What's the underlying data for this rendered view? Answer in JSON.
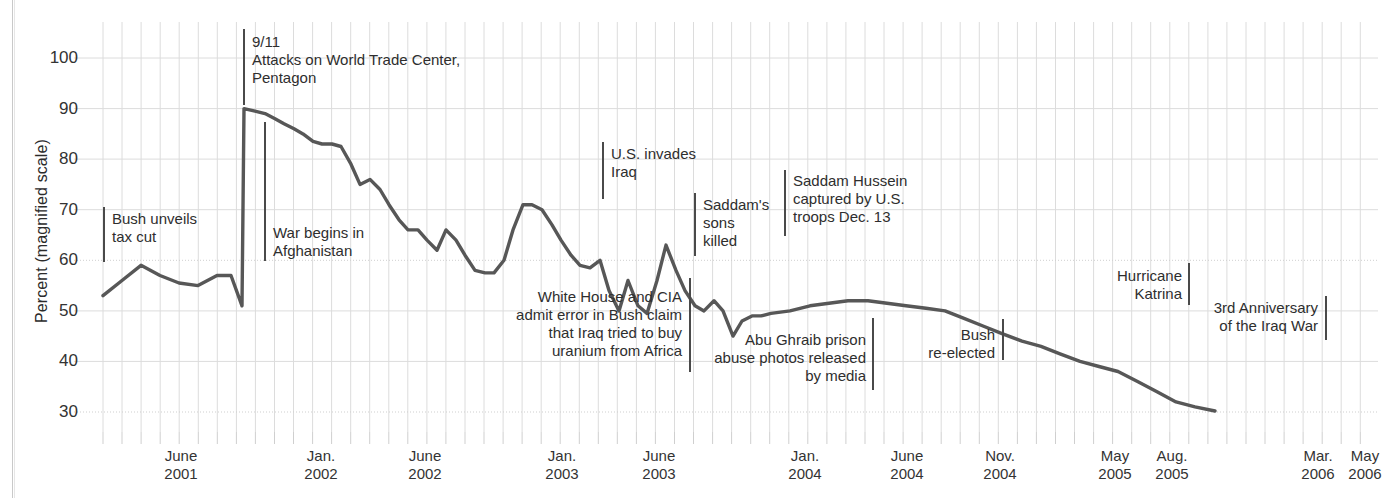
{
  "figure": {
    "width": 1385,
    "height": 498,
    "background": "#ffffff",
    "line_color": "#575757",
    "grid_color": "#dcdcdc",
    "text_color": "#2e2e2e"
  },
  "chart_data": {
    "type": "line",
    "title": "",
    "subtitle": "",
    "xlabel": "",
    "ylabel": "Percent (magnified scale)",
    "ylim": [
      28,
      104
    ],
    "yticks": [
      30,
      40,
      50,
      60,
      70,
      80,
      90,
      100
    ],
    "grid": true,
    "legend": "none",
    "xtick_labels": [
      {
        "line1": "June",
        "line2": "2001",
        "x_px": 181
      },
      {
        "line1": "Jan.",
        "line2": "2002",
        "x_px": 321
      },
      {
        "line1": "June",
        "line2": "2002",
        "x_px": 425
      },
      {
        "line1": "Jan.",
        "line2": "2003",
        "x_px": 562
      },
      {
        "line1": "June",
        "line2": "2003",
        "x_px": 659
      },
      {
        "line1": "Jan.",
        "line2": "2004",
        "x_px": 805
      },
      {
        "line1": "June",
        "line2": "2004",
        "x_px": 907
      },
      {
        "line1": "Nov.",
        "line2": "2004",
        "x_px": 1000
      },
      {
        "line1": "May",
        "line2": "2005",
        "x_px": 1115
      },
      {
        "line1": "Aug.",
        "line2": "2005",
        "x_px": 1172
      },
      {
        "line1": "Mar.",
        "line2": "2006",
        "x_px": 1318
      },
      {
        "line1": "May",
        "line2": "2006",
        "x_px": 1365
      }
    ],
    "series": [
      {
        "name": "Presidential approval",
        "points": [
          [
            103,
            53
          ],
          [
            122,
            56
          ],
          [
            141,
            59
          ],
          [
            160,
            57
          ],
          [
            179,
            55.5
          ],
          [
            198,
            55
          ],
          [
            217,
            57
          ],
          [
            231,
            57
          ],
          [
            242,
            51
          ],
          [
            244,
            90
          ],
          [
            255,
            89.5
          ],
          [
            265,
            89
          ],
          [
            275,
            88
          ],
          [
            284,
            87
          ],
          [
            294,
            86
          ],
          [
            303,
            85
          ],
          [
            313,
            83.5
          ],
          [
            322,
            83
          ],
          [
            332,
            83
          ],
          [
            341,
            82.5
          ],
          [
            351,
            79
          ],
          [
            360,
            75
          ],
          [
            370,
            76
          ],
          [
            380,
            74
          ],
          [
            389,
            71
          ],
          [
            399,
            68
          ],
          [
            408,
            66
          ],
          [
            418,
            66
          ],
          [
            427,
            64
          ],
          [
            437,
            62
          ],
          [
            446,
            66
          ],
          [
            456,
            64
          ],
          [
            465,
            61
          ],
          [
            475,
            58
          ],
          [
            485,
            57.5
          ],
          [
            494,
            57.5
          ],
          [
            504,
            60
          ],
          [
            513,
            66
          ],
          [
            523,
            71
          ],
          [
            532,
            71
          ],
          [
            542,
            70
          ],
          [
            552,
            67
          ],
          [
            561,
            64
          ],
          [
            571,
            61
          ],
          [
            580,
            59
          ],
          [
            590,
            58.5
          ],
          [
            600,
            60
          ],
          [
            609,
            54
          ],
          [
            619,
            50
          ],
          [
            628,
            56
          ],
          [
            638,
            51
          ],
          [
            647,
            49.5
          ],
          [
            657,
            56
          ],
          [
            666,
            63
          ],
          [
            676,
            58
          ],
          [
            685,
            54
          ],
          [
            695,
            51
          ],
          [
            704,
            50
          ],
          [
            714,
            52
          ],
          [
            723,
            50
          ],
          [
            733,
            45
          ],
          [
            742,
            48
          ],
          [
            752,
            49
          ],
          [
            761,
            49
          ],
          [
            771,
            49.5
          ],
          [
            790,
            50
          ],
          [
            810,
            51
          ],
          [
            829,
            51.5
          ],
          [
            848,
            52
          ],
          [
            868,
            52
          ],
          [
            887,
            51.5
          ],
          [
            906,
            51
          ],
          [
            926,
            50.5
          ],
          [
            945,
            50
          ],
          [
            964,
            48.5
          ],
          [
            983,
            47
          ],
          [
            1002,
            45.5
          ],
          [
            1022,
            44
          ],
          [
            1041,
            43
          ],
          [
            1060,
            41.5
          ],
          [
            1080,
            40
          ],
          [
            1099,
            39
          ],
          [
            1118,
            38
          ],
          [
            1138,
            36
          ],
          [
            1157,
            34
          ],
          [
            1176,
            32
          ],
          [
            1195,
            31
          ],
          [
            1215,
            30.2
          ]
        ]
      }
    ],
    "annotations": [
      {
        "id": "bush-tax-cut",
        "text": "Bush unveils\ntax cut",
        "align": "left",
        "text_x_px": 112,
        "text_y_px": 210,
        "rule_x_px": 103,
        "rule_y_px": 207,
        "rule_h_px": 55
      },
      {
        "id": "nine-eleven",
        "text": "9/11\nAttacks on World Trade Center,\nPentagon",
        "align": "left",
        "text_x_px": 252,
        "text_y_px": 33,
        "rule_x_px": 243,
        "rule_y_px": 29,
        "rule_h_px": 76
      },
      {
        "id": "afghanistan-war",
        "text": "War begins in\nAfghanistan",
        "align": "left",
        "text_x_px": 273,
        "text_y_px": 224,
        "rule_x_px": 264,
        "rule_y_px": 122,
        "rule_h_px": 139
      },
      {
        "id": "us-invades-iraq",
        "text": "U.S. invades\nIraq",
        "align": "left",
        "text_x_px": 611,
        "text_y_px": 145,
        "rule_x_px": 602,
        "rule_y_px": 142,
        "rule_h_px": 57
      },
      {
        "id": "uranium-africa",
        "text": "White House and CIA\nadmit error in Bush claim\nthat Iraq tried to buy\nuranium from Africa",
        "align": "right",
        "text_x_px": 682,
        "text_y_px": 288,
        "rule_x_px": 689,
        "rule_y_px": 278,
        "rule_h_px": 94
      },
      {
        "id": "saddams-sons-killed",
        "text": "Saddam's\nsons\nkilled",
        "align": "left",
        "text_x_px": 703,
        "text_y_px": 196,
        "rule_x_px": 694,
        "rule_y_px": 193,
        "rule_h_px": 63
      },
      {
        "id": "saddam-captured",
        "text": "Saddam Hussein\ncaptured by U.S.\ntroops Dec. 13",
        "align": "left",
        "text_x_px": 793,
        "text_y_px": 172,
        "rule_x_px": 784,
        "rule_y_px": 170,
        "rule_h_px": 66
      },
      {
        "id": "abu-ghraib",
        "text": "Abu Ghraib prison\nabuse photos released\nby media",
        "align": "right",
        "text_x_px": 866,
        "text_y_px": 331,
        "rule_x_px": 872,
        "rule_y_px": 318,
        "rule_h_px": 72
      },
      {
        "id": "bush-re-elected",
        "text": "Bush\nre-elected",
        "align": "right",
        "text_x_px": 995,
        "text_y_px": 326,
        "rule_x_px": 1002,
        "rule_y_px": 319,
        "rule_h_px": 41
      },
      {
        "id": "hurricane-katrina",
        "text": "Hurricane\nKatrina",
        "align": "right",
        "text_x_px": 1182,
        "text_y_px": 267,
        "rule_x_px": 1188,
        "rule_y_px": 263,
        "rule_h_px": 42
      },
      {
        "id": "third-anniversary-iraq-war",
        "text": "3rd Anniversary\nof the Iraq War",
        "align": "right",
        "text_x_px": 1318,
        "text_y_px": 299,
        "rule_x_px": 1325,
        "rule_y_px": 296,
        "rule_h_px": 44
      }
    ]
  }
}
